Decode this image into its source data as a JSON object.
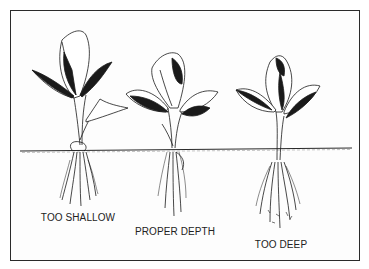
{
  "figure": {
    "ground_line": true,
    "plants": [
      {
        "id": "too-shallow",
        "label": "TOO SHALLOW",
        "label_x": 78,
        "label_y": 213
      },
      {
        "id": "proper-depth",
        "label": "PROPER DEPTH",
        "label_x": 175,
        "label_y": 227
      },
      {
        "id": "too-deep",
        "label": "TOO DEEP",
        "label_x": 281,
        "label_y": 240
      }
    ]
  },
  "colors": {
    "ink": "#1a1a1a",
    "paper": "#fdfdfd",
    "frame": "#2a2a2a"
  }
}
